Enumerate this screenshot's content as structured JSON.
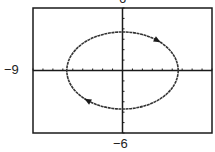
{
  "chart_data": {
    "type": "line",
    "title": "",
    "subtitle": "",
    "xlabel": "",
    "ylabel": "",
    "xlim": [
      -9,
      9
    ],
    "ylim": [
      -6,
      6
    ],
    "x_tick_step": 1,
    "y_tick_step": 1,
    "grid": false,
    "legend": null,
    "window_labels": {
      "xmin": "−9",
      "xmax": "9",
      "ymin": "−6",
      "ymax": "6"
    },
    "series": [
      {
        "name": "ellipse",
        "kind": "parametric",
        "center": [
          0,
          0
        ],
        "semi_axis_x": 5.6,
        "semi_axis_y": 3.7,
        "direction": "clockwise",
        "arrows": [
          {
            "position": "upper-right",
            "at_point": [
              3.6,
              2.8
            ],
            "pointing": "down-right"
          },
          {
            "position": "lower-left",
            "at_point": [
              -3.6,
              -2.8
            ],
            "pointing": "up-left"
          }
        ]
      }
    ]
  },
  "labels": {
    "top": "6",
    "left": "−9",
    "bottom": "−6"
  },
  "colors": {
    "frame": "#1a1a1a",
    "axes": "#1a1a1a",
    "curve": "#333333",
    "background": "#ffffff"
  }
}
